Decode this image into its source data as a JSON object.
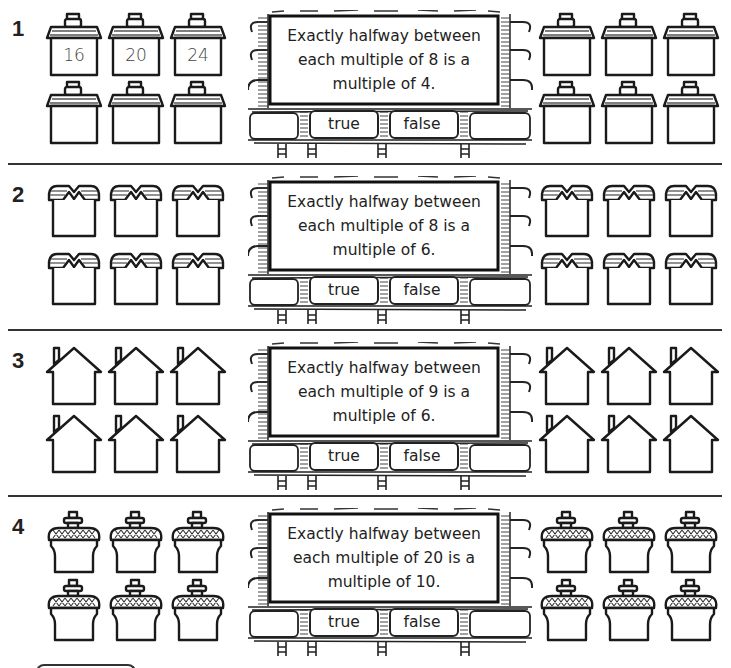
{
  "worksheet": {
    "answer_options": {
      "true_label": "true",
      "false_label": "false"
    },
    "questions": [
      {
        "number": "1",
        "house_style": "flat-roof-chimney",
        "statement": "Exactly halfway between each multiple of 8 is a multiple of 4.",
        "left_houses": [
          "16",
          "20",
          "24",
          "",
          "",
          ""
        ],
        "right_houses": [
          "",
          "",
          "",
          "",
          "",
          ""
        ]
      },
      {
        "number": "2",
        "house_style": "gabled-awning",
        "statement": "Exactly halfway between each multiple of 8 is a multiple of 6.",
        "left_houses": [
          "",
          "",
          "",
          "",
          "",
          ""
        ],
        "right_houses": [
          "",
          "",
          "",
          "",
          "",
          ""
        ]
      },
      {
        "number": "3",
        "house_style": "pointed-roof-chimney",
        "statement": "Exactly halfway between each multiple of 9 is a multiple of 6.",
        "left_houses": [
          "",
          "",
          "",
          "",
          "",
          ""
        ],
        "right_houses": [
          "",
          "",
          "",
          "",
          "",
          ""
        ]
      },
      {
        "number": "4",
        "house_style": "acorn-crosshatch-roof",
        "statement": "Exactly halfway between each multiple of 20 is a multiple of 10.",
        "left_houses": [
          "",
          "",
          "",
          "",
          "",
          ""
        ],
        "right_houses": [
          "",
          "",
          "",
          "",
          "",
          ""
        ]
      }
    ]
  },
  "colors": {
    "ink": "#1a1a1a",
    "paper": "#ffffff",
    "number_ink": "#444444"
  }
}
